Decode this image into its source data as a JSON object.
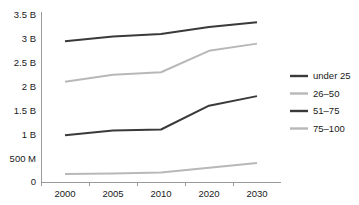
{
  "chart_data": {
    "type": "line",
    "title": "",
    "xlabel": "",
    "ylabel": "",
    "categories": [
      "2000",
      "2005",
      "2010",
      "2020",
      "2030"
    ],
    "x_tick_labels": [
      "2000",
      "2005",
      "2010",
      "2020",
      "2030"
    ],
    "y_tick_labels": [
      "0",
      "500 M",
      "1 B",
      "1.5 B",
      "2 B",
      "2.5 B",
      "3 B",
      "3.5 B"
    ],
    "y_tick_values": [
      0,
      0.5,
      1,
      1.5,
      2,
      2.5,
      3,
      3.5
    ],
    "ylim": [
      0,
      3.5
    ],
    "y_unit": "billions",
    "grid": false,
    "legend_position": "right",
    "series": [
      {
        "name": "under 25",
        "color": "#3a3a3a",
        "width": 2.0,
        "values": [
          2.95,
          3.05,
          3.1,
          3.25,
          3.35
        ]
      },
      {
        "name": "26–50",
        "color": "#b8b8b8",
        "width": 2.0,
        "values": [
          2.1,
          2.25,
          2.3,
          2.75,
          2.9
        ]
      },
      {
        "name": "51–75",
        "color": "#3a3a3a",
        "width": 2.0,
        "values": [
          0.98,
          1.08,
          1.1,
          1.6,
          1.8
        ]
      },
      {
        "name": "75–100",
        "color": "#b8b8b8",
        "width": 2.0,
        "values": [
          0.17,
          0.18,
          0.2,
          0.3,
          0.4
        ]
      }
    ]
  },
  "legend": {
    "items": [
      {
        "label": "under 25",
        "color": "#3a3a3a"
      },
      {
        "label": "26–50",
        "color": "#b8b8b8"
      },
      {
        "label": "51–75",
        "color": "#3a3a3a"
      },
      {
        "label": "75–100",
        "color": "#b8b8b8"
      }
    ]
  },
  "axes": {
    "y_axis_color": "#9a9a9a",
    "x_axis_color": "#9a9a9a"
  }
}
